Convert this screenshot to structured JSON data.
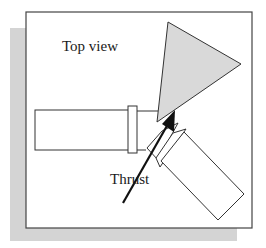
{
  "diagram": {
    "title_label": "Top view",
    "thrust_label": "Thrust",
    "colors": {
      "shadow": "#d4d4d4",
      "frame_border": "#444444",
      "plume_fill": "#d9d9d9",
      "line": "#333333",
      "arrow": "#111111"
    }
  }
}
